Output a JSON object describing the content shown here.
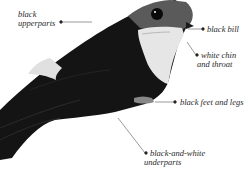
{
  "diagram": {
    "labels": [
      {
        "id": "upperparts",
        "lines": [
          "black",
          "upperparts"
        ]
      },
      {
        "id": "bill",
        "lines": [
          "black bill"
        ]
      },
      {
        "id": "chin",
        "lines": [
          "white chin",
          "and throat"
        ]
      },
      {
        "id": "feet",
        "lines": [
          "black feet and legs"
        ]
      },
      {
        "id": "underparts",
        "lines": [
          "black-and-white",
          "underparts"
        ]
      }
    ],
    "colors": {
      "background": "#ffffff",
      "bird_dark": "#141414",
      "bird_light": "#e8e8e8",
      "leader_line": "#555555",
      "text": "#2a2a2a"
    }
  }
}
